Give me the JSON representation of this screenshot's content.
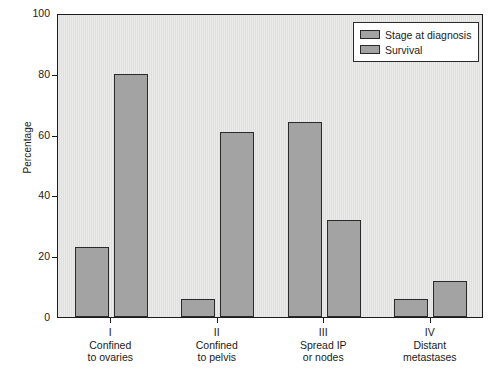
{
  "chart_data": {
    "type": "bar",
    "title": "",
    "subtitle": "",
    "xlabel": "",
    "ylabel": "Percentage",
    "ylim": [
      0,
      100
    ],
    "yticks": [
      0,
      20,
      40,
      60,
      80,
      100
    ],
    "ytick_labels": [
      "0",
      "20",
      "40",
      "60",
      "80",
      "100"
    ],
    "grid": false,
    "legend_position": "top-right",
    "categories": [
      "I",
      "II",
      "III",
      "IV"
    ],
    "category_sublabels": [
      [
        "Confined",
        "to ovaries"
      ],
      [
        "Confined",
        "to pelvis"
      ],
      [
        "Spread IP",
        "or nodes"
      ],
      [
        "Distant",
        "metastases"
      ]
    ],
    "series": [
      {
        "name": "Stage at diagnosis",
        "values": [
          23,
          6,
          64,
          6
        ],
        "color": "#a3a3a3"
      },
      {
        "name": "Survival",
        "values": [
          80,
          61,
          32,
          12
        ],
        "color": "#a3a3a3"
      }
    ]
  },
  "axes": {
    "y_title": "Percentage",
    "y_tick_labels": [
      "100",
      "80",
      "60",
      "40",
      "20",
      "0"
    ]
  },
  "legend": {
    "entries": [
      {
        "label": "Stage at diagnosis"
      },
      {
        "label": "Survival"
      }
    ]
  },
  "colors": {
    "bar_fill": "#a3a3a3",
    "bar_edge": "#2a2a2a",
    "plot_background": "#e2e2e1",
    "figure_background": "#ffffff",
    "text": "#1a1a1a"
  }
}
